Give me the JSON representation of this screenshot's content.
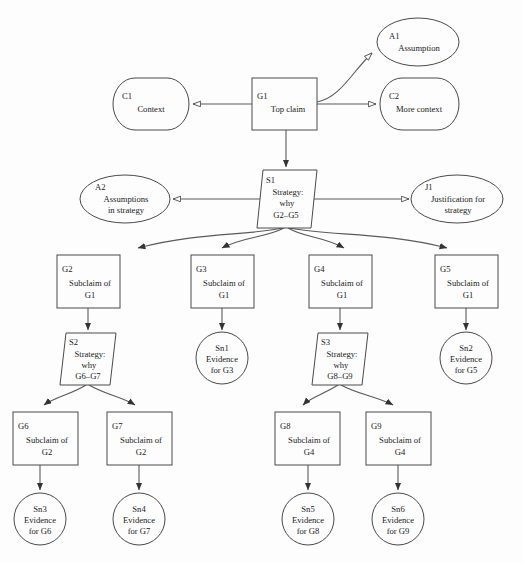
{
  "diagram": {
    "type": "gsn-argument-tree",
    "background_color": "#fdfdfd",
    "line_color": "#5a5a5a",
    "text_color": "#1a1a1a"
  },
  "nodes": {
    "g1": {
      "id": "G1",
      "lines": [
        "Top claim"
      ],
      "shape": "goal-rectangle"
    },
    "c1": {
      "id": "C1",
      "lines": [
        "Context"
      ],
      "shape": "context-rounded"
    },
    "c2": {
      "id": "C2",
      "lines": [
        "More context"
      ],
      "shape": "context-rounded"
    },
    "a1": {
      "id": "A1",
      "lines": [
        "Assumption"
      ],
      "shape": "assumption-ellipse"
    },
    "a2": {
      "id": "A2",
      "lines": [
        "Assumptions",
        "in strategy"
      ],
      "shape": "assumption-ellipse"
    },
    "j1": {
      "id": "J1",
      "lines": [
        "Justification for",
        "strategy"
      ],
      "shape": "justification-ellipse"
    },
    "s1": {
      "id": "S1",
      "lines": [
        "Strategy:",
        "why",
        "G2–G5"
      ],
      "shape": "strategy-parallelogram"
    },
    "s2": {
      "id": "S2",
      "lines": [
        "Strategy:",
        "why",
        "G6–G7"
      ],
      "shape": "strategy-parallelogram"
    },
    "s3": {
      "id": "S3",
      "lines": [
        "Strategy:",
        "why",
        "G8–G9"
      ],
      "shape": "strategy-parallelogram"
    },
    "g2": {
      "id": "G2",
      "lines": [
        "Subclaim of",
        "G1"
      ],
      "shape": "goal-rectangle"
    },
    "g3": {
      "id": "G3",
      "lines": [
        "Subclaim of",
        "G1"
      ],
      "shape": "goal-rectangle"
    },
    "g4": {
      "id": "G4",
      "lines": [
        "Subclaim of",
        "G1"
      ],
      "shape": "goal-rectangle"
    },
    "g5": {
      "id": "G5",
      "lines": [
        "Subclaim of",
        "G1"
      ],
      "shape": "goal-rectangle"
    },
    "g6": {
      "id": "G6",
      "lines": [
        "Subclaim of",
        "G2"
      ],
      "shape": "goal-rectangle"
    },
    "g7": {
      "id": "G7",
      "lines": [
        "Subclaim of",
        "G2"
      ],
      "shape": "goal-rectangle"
    },
    "g8": {
      "id": "G8",
      "lines": [
        "Subclaim of",
        "G4"
      ],
      "shape": "goal-rectangle"
    },
    "g9": {
      "id": "G9",
      "lines": [
        "Subclaim of",
        "G4"
      ],
      "shape": "goal-rectangle"
    },
    "sn1": {
      "id": "Sn1",
      "lines": [
        "Evidence",
        "for G3"
      ],
      "shape": "solution-circle"
    },
    "sn2": {
      "id": "Sn2",
      "lines": [
        "Evidence",
        "for G5"
      ],
      "shape": "solution-circle"
    },
    "sn3": {
      "id": "Sn3",
      "lines": [
        "Evidence",
        "for G6"
      ],
      "shape": "solution-circle"
    },
    "sn4": {
      "id": "Sn4",
      "lines": [
        "Evidence",
        "for G7"
      ],
      "shape": "solution-circle"
    },
    "sn5": {
      "id": "Sn5",
      "lines": [
        "Evidence",
        "for G8"
      ],
      "shape": "solution-circle"
    },
    "sn6": {
      "id": "Sn6",
      "lines": [
        "Evidence",
        "for G9"
      ],
      "shape": "solution-circle"
    }
  },
  "edges": [
    {
      "from": "G1",
      "to": "C1",
      "arrow": "hollow",
      "relation": "in-context-of"
    },
    {
      "from": "G1",
      "to": "C2",
      "arrow": "hollow",
      "relation": "in-context-of"
    },
    {
      "from": "G1",
      "to": "A1",
      "arrow": "hollow",
      "relation": "in-context-of"
    },
    {
      "from": "G1",
      "to": "S1",
      "arrow": "solid",
      "relation": "supported-by"
    },
    {
      "from": "S1",
      "to": "A2",
      "arrow": "hollow",
      "relation": "in-context-of"
    },
    {
      "from": "S1",
      "to": "J1",
      "arrow": "hollow",
      "relation": "in-context-of"
    },
    {
      "from": "S1",
      "to": "G2",
      "arrow": "solid",
      "relation": "supported-by"
    },
    {
      "from": "S1",
      "to": "G3",
      "arrow": "solid",
      "relation": "supported-by"
    },
    {
      "from": "S1",
      "to": "G4",
      "arrow": "solid",
      "relation": "supported-by"
    },
    {
      "from": "S1",
      "to": "G5",
      "arrow": "solid",
      "relation": "supported-by"
    },
    {
      "from": "G2",
      "to": "S2",
      "arrow": "solid",
      "relation": "supported-by"
    },
    {
      "from": "G3",
      "to": "Sn1",
      "arrow": "solid",
      "relation": "supported-by"
    },
    {
      "from": "G4",
      "to": "S3",
      "arrow": "solid",
      "relation": "supported-by"
    },
    {
      "from": "G5",
      "to": "Sn2",
      "arrow": "solid",
      "relation": "supported-by"
    },
    {
      "from": "S2",
      "to": "G6",
      "arrow": "solid",
      "relation": "supported-by"
    },
    {
      "from": "S2",
      "to": "G7",
      "arrow": "solid",
      "relation": "supported-by"
    },
    {
      "from": "S3",
      "to": "G8",
      "arrow": "solid",
      "relation": "supported-by"
    },
    {
      "from": "S3",
      "to": "G9",
      "arrow": "solid",
      "relation": "supported-by"
    },
    {
      "from": "G6",
      "to": "Sn3",
      "arrow": "solid",
      "relation": "supported-by"
    },
    {
      "from": "G7",
      "to": "Sn4",
      "arrow": "solid",
      "relation": "supported-by"
    },
    {
      "from": "G8",
      "to": "Sn5",
      "arrow": "solid",
      "relation": "supported-by"
    },
    {
      "from": "G9",
      "to": "Sn6",
      "arrow": "solid",
      "relation": "supported-by"
    }
  ]
}
